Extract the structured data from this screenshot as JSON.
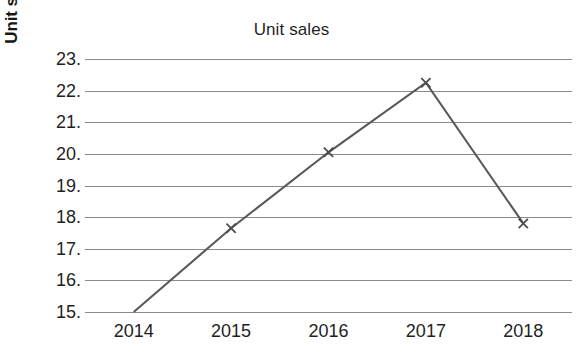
{
  "chart_data": {
    "type": "line",
    "title": "Unit sales",
    "xlabel": "",
    "ylabel": "Unit sales (millions)",
    "x": [
      2014,
      2015,
      2016,
      2017,
      2018
    ],
    "categories": [
      "2014",
      "2015",
      "2016",
      "2017",
      "2018"
    ],
    "values": [
      15.0,
      17.65,
      20.05,
      22.25,
      17.8
    ],
    "series": [
      {
        "name": "Unit sales",
        "values": [
          15.0,
          17.65,
          20.05,
          22.25,
          17.8
        ]
      }
    ],
    "ylim": [
      15,
      23
    ],
    "xlim": [
      2013.5,
      2018.5
    ],
    "yticks": [
      15,
      16,
      17,
      18,
      19,
      20,
      21,
      22,
      23
    ],
    "ytick_labels": [
      "15.",
      "16.",
      "17.",
      "18.",
      "19.",
      "20.",
      "21.",
      "22.",
      "23."
    ],
    "xtick_labels": [
      "2014",
      "2015",
      "2016",
      "2017",
      "2018"
    ],
    "grid": true,
    "grid_axis": "y",
    "legend": false,
    "legend_position": "none",
    "marker": "x",
    "marker_points": [
      {
        "x": 2015,
        "y": 17.65
      },
      {
        "x": 2016,
        "y": 20.05
      },
      {
        "x": 2017,
        "y": 22.25
      },
      {
        "x": 2018,
        "y": 17.8
      }
    ],
    "colors": {
      "line": "#595959",
      "marker": "#4d4d4d",
      "grid": "#8c8c8c",
      "text": "#1f1f1f",
      "background": "#ffffff"
    }
  }
}
